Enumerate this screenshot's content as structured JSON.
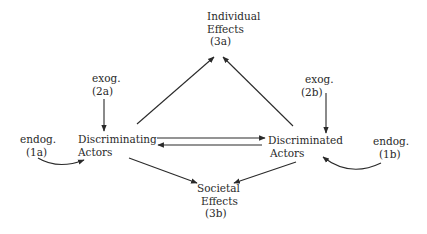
{
  "diagram": {
    "type": "causal flow diagram",
    "nodes": {
      "individual_effects": {
        "line1": "Individual",
        "line2": "Effects",
        "line3": "(3a)"
      },
      "societal_effects": {
        "line1": "Societal",
        "line2": "Effects",
        "line3": "(3b)"
      },
      "discriminating_actors": {
        "line1": "Discriminating",
        "line2": "Actors"
      },
      "discriminated_actors": {
        "line1": "Discriminated",
        "line2": "Actors"
      },
      "exog_2a": {
        "line1": "exog.",
        "line2": "(2a)"
      },
      "exog_2b": {
        "line1": "exog.",
        "line2": "(2b)"
      },
      "endog_1a": {
        "line1": "endog.",
        "line2": "(1a)"
      },
      "endog_1b": {
        "line1": "endog.",
        "line2": "(1b)"
      }
    },
    "edges": [
      {
        "from": "exog_2a",
        "to": "discriminating_actors",
        "style": "straight"
      },
      {
        "from": "exog_2b",
        "to": "discriminated_actors",
        "style": "straight"
      },
      {
        "from": "endog_1a",
        "to": "discriminating_actors",
        "style": "curved"
      },
      {
        "from": "endog_1b",
        "to": "discriminated_actors",
        "style": "curved"
      },
      {
        "from": "discriminating_actors",
        "to": "discriminated_actors",
        "style": "straight"
      },
      {
        "from": "discriminated_actors",
        "to": "discriminating_actors",
        "style": "straight"
      },
      {
        "from": "discriminating_actors",
        "to": "individual_effects",
        "style": "straight"
      },
      {
        "from": "discriminated_actors",
        "to": "individual_effects",
        "style": "straight"
      },
      {
        "from": "discriminating_actors",
        "to": "societal_effects",
        "style": "straight"
      },
      {
        "from": "discriminated_actors",
        "to": "societal_effects",
        "style": "straight"
      }
    ],
    "colors": {
      "ink": "#2a2a2a",
      "background": "#ffffff"
    }
  }
}
